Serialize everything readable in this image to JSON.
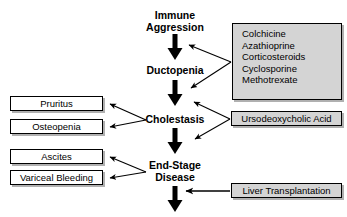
{
  "diagram": {
    "colors": {
      "background": "#ffffff",
      "stroke": "#000000",
      "box_fill": "#ffffff",
      "gray_fill": "#d4d4d4",
      "shadow": "#b0b0b0"
    },
    "spine": [
      {
        "id": "immune-aggression",
        "label": "Immune\nAggression"
      },
      {
        "id": "ductopenia",
        "label": "Ductopenia"
      },
      {
        "id": "cholestasis",
        "label": "Cholestasis"
      },
      {
        "id": "end-stage-disease",
        "label": "End-Stage\nDisease"
      }
    ],
    "complication_boxes": [
      {
        "id": "pruritus",
        "label": "Pruritus"
      },
      {
        "id": "osteopenia",
        "label": "Osteopenia"
      },
      {
        "id": "ascites",
        "label": "Ascites"
      },
      {
        "id": "variceal-bleeding",
        "label": "Variceal Bleeding"
      }
    ],
    "treatment_boxes": [
      {
        "id": "immunosuppressive-drugs",
        "label": "Colchicine\nAzathioprine\nCorticosteroids\nCyclosporine\nMethotrexate",
        "drugs": [
          "Colchicine",
          "Azathioprine",
          "Corticosteroids",
          "Cyclosporine",
          "Methotrexate"
        ]
      },
      {
        "id": "ursodeoxycholic-acid",
        "label": "Ursodeoxycholic Acid"
      },
      {
        "id": "liver-transplantation",
        "label": "Liver Transplantation"
      }
    ],
    "edges": [
      {
        "from": "immune-aggression",
        "to": "ductopenia",
        "style": "thick-down"
      },
      {
        "from": "ductopenia",
        "to": "cholestasis",
        "style": "thick-down"
      },
      {
        "from": "cholestasis",
        "to": "end-stage-disease",
        "style": "thick-down"
      },
      {
        "from": "end-stage-disease",
        "to": "outcome",
        "style": "thick-down"
      },
      {
        "from": "cholestasis",
        "to": "pruritus",
        "style": "thin"
      },
      {
        "from": "cholestasis",
        "to": "osteopenia",
        "style": "thin"
      },
      {
        "from": "end-stage-disease",
        "to": "ascites",
        "style": "thin"
      },
      {
        "from": "end-stage-disease",
        "to": "variceal-bleeding",
        "style": "thin"
      },
      {
        "from": "immunosuppressive-drugs",
        "to": "immune-aggression-axis",
        "style": "thin"
      },
      {
        "from": "immunosuppressive-drugs",
        "to": "ductopenia-axis",
        "style": "thin"
      },
      {
        "from": "ursodeoxycholic-acid",
        "to": "ductopenia-axis",
        "style": "thin"
      },
      {
        "from": "ursodeoxycholic-acid",
        "to": "cholestasis-axis",
        "style": "thin"
      },
      {
        "from": "liver-transplantation",
        "to": "end-stage-axis",
        "style": "thin"
      }
    ]
  }
}
